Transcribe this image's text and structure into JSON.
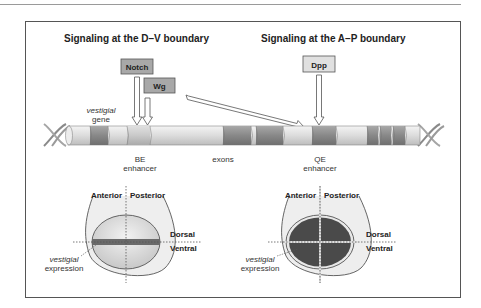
{
  "figure": {
    "left_panel": {
      "title": "Signaling at the D–V boundary",
      "signals": [
        "Notch",
        "Wg"
      ],
      "enhancer_label_line1": "BE",
      "enhancer_label_line2": "enhancer",
      "disc": {
        "anterior": "Anterior",
        "posterior": "Posterior",
        "dorsal": "Dorsal",
        "ventral": "Ventral",
        "expr_line1": "vestigial",
        "expr_line2": "expression"
      }
    },
    "right_panel": {
      "title": "Signaling at the A–P boundary",
      "signals": [
        "Dpp"
      ],
      "enhancer_label_line1": "QE",
      "enhancer_label_line2": "enhancer",
      "disc": {
        "anterior": "Anterior",
        "posterior": "Posterior",
        "dorsal": "Dorsal",
        "ventral": "Ventral",
        "expr_line1": "vestigial",
        "expr_line2": "expression"
      }
    },
    "gene": {
      "label_line1": "vestigial",
      "label_line2": "gene",
      "exons_label": "exons"
    },
    "colors": {
      "signal_box": "#a8a8a8",
      "exon_dark": "#8a8a8a",
      "exon_light": "#d0d0d0",
      "gene_body": "#e4e4e4",
      "expression_dark": "#4a4a4a",
      "disc_fill": "#e6e6e6"
    }
  }
}
